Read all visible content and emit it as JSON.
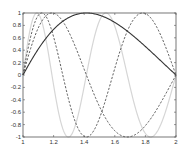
{
  "chart_data": {
    "type": "line",
    "title": "",
    "xlabel": "",
    "ylabel": "",
    "xlim": [
      1,
      2
    ],
    "ylim": [
      -1,
      1
    ],
    "grid": false,
    "legend": null,
    "x_ticks": [
      "1",
      "1.2",
      "1.4",
      "1.6",
      "1.8",
      "2"
    ],
    "y_ticks": [
      "-1",
      "-0.8",
      "-0.6",
      "-0.4",
      "-0.2",
      "0",
      "0.2",
      "0.4",
      "0.6",
      "0.8",
      "1"
    ],
    "x": [
      1.0,
      1.05,
      1.1,
      1.15,
      1.2,
      1.25,
      1.3,
      1.35,
      1.4,
      1.45,
      1.5,
      1.55,
      1.6,
      1.65,
      1.7,
      1.75,
      1.8,
      1.85,
      1.9,
      1.95,
      2.0
    ],
    "series": [
      {
        "name": "sin(pi*log2(x))",
        "k": 1,
        "style": "solid",
        "color": "#333333",
        "width": 1.1,
        "values": [
          0.0,
          0.22,
          0.42,
          0.59,
          0.74,
          0.86,
          0.94,
          0.99,
          1.0,
          0.99,
          0.95,
          0.89,
          0.81,
          0.72,
          0.62,
          0.51,
          0.39,
          0.27,
          0.15,
          0.07,
          0.0
        ]
      },
      {
        "name": "sin(2*pi*log2(x))",
        "k": 2,
        "style": "dashed",
        "color": "#333333",
        "width": 0.8,
        "values": [
          0.0,
          0.43,
          0.77,
          0.96,
          1.0,
          0.89,
          0.67,
          0.37,
          0.04,
          -0.28,
          -0.57,
          -0.8,
          -0.95,
          -1.0,
          -0.97,
          -0.87,
          -0.71,
          -0.51,
          -0.29,
          -0.07,
          0.0
        ]
      },
      {
        "name": "sin(3*pi*log2(x))",
        "k": 3,
        "style": "dashed",
        "color": "#333333",
        "width": 0.8,
        "values": [
          0.0,
          0.61,
          0.98,
          0.91,
          0.48,
          -0.12,
          -0.66,
          -0.96,
          -1.0,
          -0.78,
          -0.37,
          0.1,
          0.52,
          0.85,
          0.99,
          0.97,
          0.8,
          0.51,
          0.17,
          -0.16,
          0.0
        ]
      },
      {
        "name": "sin(4*pi*log2(x))",
        "k": 4,
        "style": "solid",
        "color": "#d6d6d6",
        "width": 1.2,
        "values": [
          0.0,
          0.77,
          0.98,
          0.43,
          -0.4,
          -0.96,
          -0.99,
          -0.68,
          0.08,
          0.81,
          0.95,
          0.78,
          0.24,
          -0.37,
          -0.83,
          -1.0,
          -0.86,
          -0.51,
          -0.14,
          0.25,
          0.0
        ]
      }
    ]
  },
  "axes": {
    "frame_color": "#555555",
    "tick_color": "#555555"
  }
}
